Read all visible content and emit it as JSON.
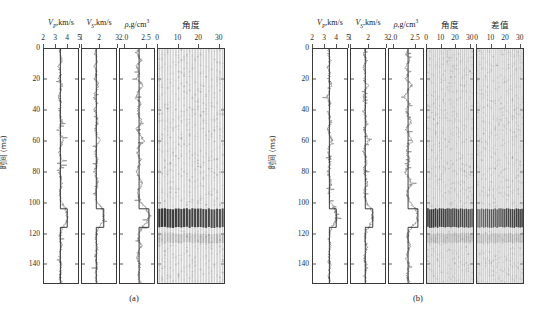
{
  "figure": {
    "yaxis": {
      "label": "时间 (ms)",
      "ticks": [
        0,
        20,
        40,
        60,
        80,
        100,
        120,
        140
      ],
      "min": 0,
      "max": 152
    },
    "panels": [
      {
        "id": "a",
        "caption": "(a)",
        "tracks": [
          {
            "name": "vp",
            "title_main": "V",
            "title_sub": "P",
            "title_rest": ",km/s",
            "title_sup": "",
            "ticks": [
              2,
              3,
              4,
              5
            ],
            "min": 2,
            "max": 5,
            "type": "log"
          },
          {
            "name": "vs",
            "title_main": "V",
            "title_sub": "S",
            "title_rest": ",km/s",
            "title_sup": "",
            "ticks": [
              1,
              2,
              3
            ],
            "min": 1,
            "max": 3,
            "type": "log"
          },
          {
            "name": "density",
            "title_main": "ρ",
            "title_sub": "",
            "title_rest": ",g/cm",
            "title_sup": "3",
            "ticks": [
              2.0,
              2.5
            ],
            "min": 1.9,
            "max": 2.7,
            "type": "log"
          },
          {
            "name": "angle-gather",
            "title_main": "角度",
            "title_sub": "",
            "title_rest": "",
            "title_sup": "",
            "ticks": [
              0,
              10,
              20,
              30
            ],
            "min": 0,
            "max": 33,
            "type": "gather"
          }
        ]
      },
      {
        "id": "b",
        "caption": "(b)",
        "tracks": [
          {
            "name": "vp",
            "title_main": "V",
            "title_sub": "P",
            "title_rest": ",km/s",
            "title_sup": "",
            "ticks": [
              2,
              3,
              4,
              5
            ],
            "min": 2,
            "max": 5,
            "type": "log"
          },
          {
            "name": "vs",
            "title_main": "V",
            "title_sub": "S",
            "title_rest": ",km/s",
            "title_sup": "",
            "ticks": [
              1,
              2,
              3
            ],
            "min": 1,
            "max": 3,
            "type": "log"
          },
          {
            "name": "density",
            "title_main": "ρ",
            "title_sub": "",
            "title_rest": ",g/cm",
            "title_sup": "3",
            "ticks": [
              2.0,
              2.5
            ],
            "min": 1.9,
            "max": 2.7,
            "type": "log"
          },
          {
            "name": "angle-gather",
            "title_main": "角度",
            "title_sub": "",
            "title_rest": "",
            "title_sup": "",
            "ticks": [
              0,
              10,
              20,
              30
            ],
            "min": 0,
            "max": 33,
            "type": "gather"
          },
          {
            "name": "difference-gather",
            "title_main": "差值",
            "title_sub": "",
            "title_rest": "",
            "title_sup": "",
            "ticks": [
              0,
              10,
              20,
              30
            ],
            "min": 0,
            "max": 33,
            "type": "gather"
          }
        ]
      }
    ]
  },
  "chart_data": {
    "type": "line",
    "title": "",
    "subtitle": "",
    "xlabel": "",
    "ylabel": "时间 (ms)",
    "ylim": [
      0,
      152
    ],
    "grid": false,
    "legend_position": "none",
    "axes": [
      {
        "name": "vp",
        "label": "V_P,km/s",
        "ticks": [
          2,
          3,
          4,
          5
        ],
        "range": [
          2,
          5
        ]
      },
      {
        "name": "vs",
        "label": "V_S,km/s",
        "ticks": [
          1,
          2,
          3
        ],
        "range": [
          1,
          3
        ]
      },
      {
        "name": "density",
        "label": "ρ,g/cm^3",
        "ticks": [
          2.0,
          2.5
        ],
        "range": [
          1.9,
          2.7
        ]
      },
      {
        "name": "angle",
        "label": "角度",
        "ticks": [
          0,
          10,
          20,
          30
        ],
        "range": [
          0,
          33
        ]
      },
      {
        "name": "difference",
        "label": "差值",
        "ticks": [
          0,
          10,
          20,
          30
        ],
        "range": [
          0,
          33
        ]
      }
    ],
    "series": [
      {
        "name": "vp",
        "unit": "km/s",
        "t": [
          0,
          4,
          8,
          12,
          16,
          20,
          24,
          28,
          32,
          36,
          40,
          44,
          48,
          52,
          56,
          60,
          64,
          68,
          72,
          76,
          80,
          84,
          88,
          92,
          96,
          100,
          104,
          108,
          112,
          116,
          120,
          124,
          128,
          132,
          136,
          140,
          144,
          148,
          152
        ],
        "values": [
          3.42,
          3.38,
          3.55,
          3.3,
          3.47,
          3.35,
          3.62,
          3.4,
          3.28,
          3.51,
          3.36,
          3.44,
          3.58,
          3.33,
          3.49,
          3.7,
          3.41,
          3.37,
          3.52,
          3.45,
          3.31,
          3.48,
          3.6,
          3.39,
          3.43,
          3.54,
          3.9,
          4.05,
          4.02,
          3.62,
          3.47,
          3.4,
          3.56,
          3.44,
          3.38,
          3.51,
          3.46,
          3.42,
          3.5
        ]
      },
      {
        "name": "vs",
        "unit": "km/s",
        "t": [
          0,
          4,
          8,
          12,
          16,
          20,
          24,
          28,
          32,
          36,
          40,
          44,
          48,
          52,
          56,
          60,
          64,
          68,
          72,
          76,
          80,
          84,
          88,
          92,
          96,
          100,
          104,
          108,
          112,
          116,
          120,
          124,
          128,
          132,
          136,
          140,
          144,
          148,
          152
        ],
        "values": [
          1.82,
          1.78,
          1.92,
          1.74,
          1.86,
          1.77,
          1.98,
          1.8,
          1.72,
          1.89,
          1.76,
          1.84,
          1.94,
          1.75,
          1.88,
          2.02,
          1.81,
          1.79,
          1.9,
          1.85,
          1.73,
          1.87,
          1.96,
          1.8,
          1.83,
          1.91,
          2.18,
          2.28,
          2.26,
          2.0,
          1.86,
          1.81,
          1.93,
          1.84,
          1.78,
          1.89,
          1.85,
          1.82,
          1.88
        ]
      },
      {
        "name": "density",
        "unit": "g/cm^3",
        "t": [
          0,
          4,
          8,
          12,
          16,
          20,
          24,
          28,
          32,
          36,
          40,
          44,
          48,
          52,
          56,
          60,
          64,
          68,
          72,
          76,
          80,
          84,
          88,
          92,
          96,
          100,
          104,
          108,
          112,
          116,
          120,
          124,
          128,
          132,
          136,
          140,
          144,
          148,
          152
        ],
        "values": [
          2.34,
          2.31,
          2.4,
          2.28,
          2.36,
          2.3,
          2.44,
          2.33,
          2.27,
          2.39,
          2.3,
          2.35,
          2.42,
          2.29,
          2.37,
          2.47,
          2.33,
          2.32,
          2.38,
          2.35,
          2.28,
          2.36,
          2.43,
          2.32,
          2.34,
          2.39,
          2.52,
          2.58,
          2.56,
          2.42,
          2.35,
          2.33,
          2.4,
          2.34,
          2.31,
          2.37,
          2.35,
          2.33,
          2.38
        ]
      }
    ],
    "events": [
      {
        "name": "main-reflection",
        "t_start": 104,
        "t_end": 116,
        "polarity": "strong-negative",
        "description": "Dominant dark reflection band across all incidence angles"
      },
      {
        "name": "secondary-event",
        "t_start": 120,
        "t_end": 126,
        "polarity": "weak",
        "description": "Low-amplitude trailing event"
      }
    ]
  }
}
